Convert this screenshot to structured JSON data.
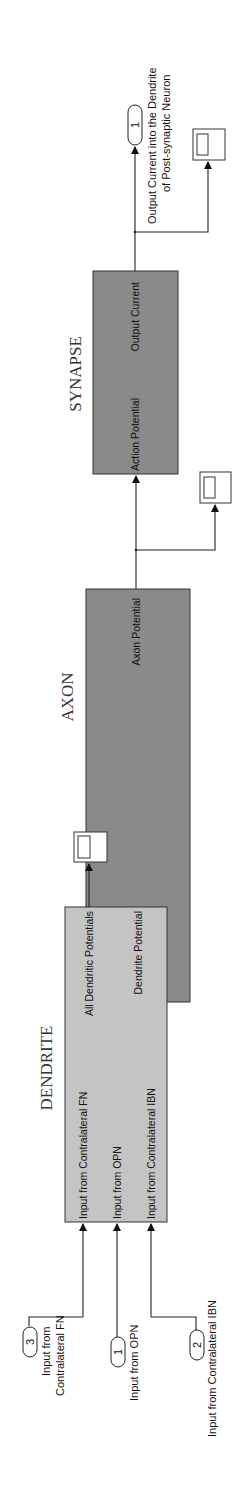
{
  "diagram": {
    "colors": {
      "dendrite_fill": "#c4c4c4",
      "axon_fill": "#8a8a8a",
      "synapse_fill": "#8a8a8a",
      "wire": "#222222"
    },
    "blocks": {
      "dendrite": {
        "title": "DENDRITE",
        "inputs": [
          "Input from Contralateral FN",
          "Input from OPN",
          "Input from Contralateral IBN"
        ],
        "outputs": [
          "All Dendritic Potentials",
          "Dendrite Potential"
        ]
      },
      "axon": {
        "title": "AXON",
        "inputs": [
          "Vm from Dendrite"
        ],
        "outputs": [
          "Axon Potential"
        ]
      },
      "synapse": {
        "title": "SYNAPSE",
        "inputs": [
          "Action Potential"
        ],
        "outputs": [
          "Output Current"
        ]
      }
    },
    "inports": [
      {
        "number": "3",
        "label_line1": "Input from",
        "label_line2": "Contralateral FN"
      },
      {
        "number": "1",
        "label_line1": "Input from OPN"
      },
      {
        "number": "2",
        "label_line1": "Input from Contralateral IBN"
      }
    ],
    "outport": {
      "number": "1",
      "label_line1": "Output Current into the Dendrite",
      "label_line2": "of Post-synaptic Neuron"
    },
    "scopes": [
      "scope-dendritic-potentials",
      "scope-axon-potential",
      "scope-output-current"
    ]
  }
}
